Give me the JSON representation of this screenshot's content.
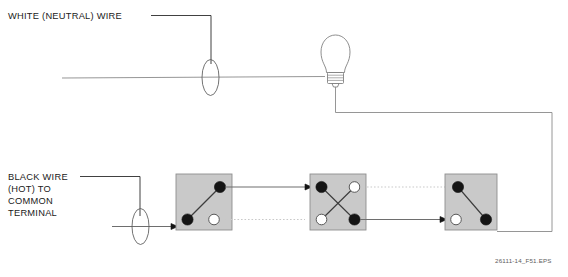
{
  "figure": {
    "caption": "26111-14_F51.EPS",
    "background_color": "#ffffff"
  },
  "labels": {
    "neutral": {
      "text": "WHITE (NEUTRAL) WIRE",
      "leader_to": "neutral-splice"
    },
    "hot_line1": "BLACK WIRE",
    "hot_line2": "(HOT) TO",
    "hot_line3": "COMMON",
    "hot_line4": "TERMINAL"
  },
  "components": {
    "lamp": {
      "name": "incandescent-lamp",
      "color": "#ffffff",
      "outline_color": "#7a7a7a"
    },
    "splices": [
      {
        "name": "neutral-splice",
        "shape": "ellipse"
      },
      {
        "name": "hot-splice",
        "shape": "ellipse"
      }
    ],
    "switches": [
      {
        "name": "three-way-switch-left",
        "type": "3-way",
        "terminals": [
          {
            "position": "top-right",
            "state": "energized"
          },
          {
            "position": "bottom-left",
            "state": "energized"
          },
          {
            "position": "bottom-right",
            "state": "open"
          }
        ],
        "blade": "bottom-left-to-top-right"
      },
      {
        "name": "four-way-switch-middle",
        "type": "4-way",
        "terminals": [
          {
            "position": "top-left",
            "state": "energized"
          },
          {
            "position": "top-right",
            "state": "open"
          },
          {
            "position": "bottom-left",
            "state": "open"
          },
          {
            "position": "bottom-right",
            "state": "energized"
          }
        ],
        "blade": "crossed"
      },
      {
        "name": "three-way-switch-right",
        "type": "3-way",
        "terminals": [
          {
            "position": "top-left",
            "state": "energized"
          },
          {
            "position": "bottom-left",
            "state": "open"
          },
          {
            "position": "bottom-right",
            "state": "energized"
          }
        ],
        "blade": "top-left-to-bottom-right"
      }
    ]
  },
  "wires": {
    "neutral_color": "#8a8a8a",
    "hot_color": "#3d3d3d",
    "traveler_inactive_color": "#c9c9c9",
    "return_color": "#8a8a8a"
  },
  "colors": {
    "box_fill": "#c9c9c9",
    "box_stroke": "#8f8f8f",
    "terminal_on": "#141414",
    "terminal_off": "#ffffff",
    "text": "#1a1a1a",
    "caption_text": "#5c5c5c"
  }
}
